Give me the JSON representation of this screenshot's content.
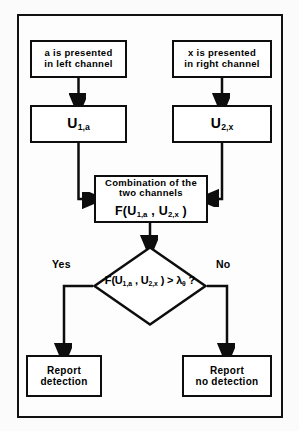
{
  "figure": {
    "type": "flowchart",
    "background_color": "#fbfbfb",
    "line_color": "#0d0d0d",
    "frame": {
      "border_color": "#111111"
    }
  },
  "nodes": {
    "left_stimulus": {
      "shape": "rectangle",
      "line1": "a is presented",
      "line2": "in left channel"
    },
    "right_stimulus": {
      "shape": "rectangle",
      "line1": "x is presented",
      "line2": "in right channel"
    },
    "u1a": {
      "shape": "rectangle",
      "symbol": "U",
      "subscript": "1,a"
    },
    "u2x": {
      "shape": "rectangle",
      "symbol": "U",
      "subscript": "2,x"
    },
    "combination": {
      "shape": "rectangle",
      "line1": "Combination of the",
      "line2": "two channels",
      "formula_prefix": "F(U",
      "formula_sub1": "1,a",
      "formula_mid": " , U",
      "formula_sub2": "2,x",
      "formula_suffix": " )"
    },
    "decision": {
      "shape": "diamond",
      "formula_prefix": "F(U",
      "formula_sub1": "1,a",
      "formula_mid": " , U",
      "formula_sub2": "2,x",
      "formula_compare": " ) > λ",
      "formula_sub3": "θ",
      "formula_suffix": " ?"
    },
    "report_detection": {
      "shape": "rectangle",
      "line1": "Report",
      "line2": "detection"
    },
    "report_no_detection": {
      "shape": "rectangle",
      "line1": "Report",
      "line2": "no detection"
    }
  },
  "branch_labels": {
    "yes": "Yes",
    "no": "No"
  },
  "edges": [
    {
      "from": "left_stimulus",
      "to": "u1a",
      "arrow": true
    },
    {
      "from": "right_stimulus",
      "to": "u2x",
      "arrow": true
    },
    {
      "from": "u1a",
      "to": "combination",
      "arrow": true
    },
    {
      "from": "u2x",
      "to": "combination",
      "arrow": true
    },
    {
      "from": "combination",
      "to": "decision",
      "arrow": true
    },
    {
      "from": "decision",
      "to": "report_detection",
      "arrow": true,
      "label": "Yes"
    },
    {
      "from": "decision",
      "to": "report_no_detection",
      "arrow": true,
      "label": "No"
    }
  ]
}
